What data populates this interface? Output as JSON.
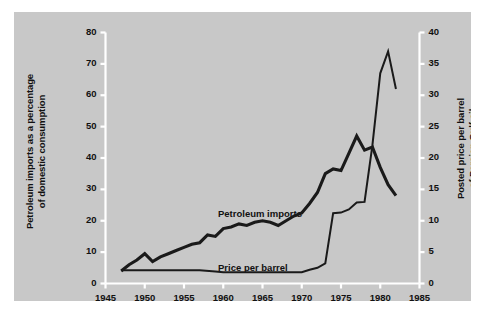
{
  "chart_data": {
    "type": "line",
    "title": "",
    "subtitle": "",
    "xlabel": "",
    "xlim": [
      1945,
      1985
    ],
    "xticks": [
      1945,
      1950,
      1955,
      1960,
      1965,
      1970,
      1975,
      1980,
      1985
    ],
    "grid": false,
    "legend_position": "inline-labels",
    "axes": [
      {
        "id": "left",
        "label": "Petroleum imports as a percentage\nof domestic consumption",
        "lim": [
          0,
          80
        ],
        "ticks": [
          0,
          10,
          20,
          30,
          40,
          50,
          60,
          70,
          80
        ]
      },
      {
        "id": "right",
        "label": "Posted price per barrel\nof Persian Gulf oil",
        "lim": [
          0,
          40
        ],
        "ticks": [
          0,
          5,
          10,
          15,
          20,
          25,
          30,
          35,
          40
        ]
      }
    ],
    "series": [
      {
        "name": "Petroleum imports",
        "axis": "left",
        "label": "Petroleum imports",
        "color": "#1a1a1a",
        "width": 3.1,
        "x": [
          1947,
          1948,
          1949,
          1950,
          1951,
          1952,
          1953,
          1954,
          1955,
          1956,
          1957,
          1958,
          1959,
          1960,
          1961,
          1962,
          1963,
          1964,
          1965,
          1966,
          1967,
          1968,
          1969,
          1970,
          1971,
          1972,
          1973,
          1974,
          1975,
          1976,
          1977,
          1978,
          1979,
          1980,
          1981,
          1982
        ],
        "y": [
          4.0,
          6.0,
          7.5,
          9.5,
          7.0,
          8.5,
          9.5,
          10.5,
          11.5,
          12.5,
          13.0,
          15.5,
          15.0,
          17.5,
          18.0,
          19.0,
          18.5,
          19.5,
          20.0,
          19.5,
          18.5,
          20.0,
          21.5,
          22.5,
          25.5,
          29.0,
          35.0,
          36.5,
          36.0,
          41.5,
          47.0,
          42.5,
          43.5,
          37.0,
          31.5,
          28.0
        ]
      },
      {
        "name": "Price per barrel",
        "axis": "right",
        "label": "Price per barrel",
        "color": "#1a1a1a",
        "width": 2.0,
        "x": [
          1947,
          1950,
          1955,
          1957,
          1959,
          1960,
          1965,
          1970,
          1971,
          1972,
          1973,
          1974,
          1975,
          1976,
          1977,
          1978,
          1979,
          1980,
          1981,
          1982
        ],
        "y": [
          2.1,
          2.1,
          2.1,
          2.1,
          1.9,
          1.8,
          1.8,
          1.8,
          2.2,
          2.5,
          3.2,
          11.2,
          11.3,
          11.8,
          12.9,
          13.0,
          22.0,
          33.5,
          37.0,
          31.0
        ]
      }
    ]
  },
  "colors": {
    "panel_background": "#c8c8c8",
    "figure_background": "#ffffff",
    "axis_line": "#ffffff",
    "line": "#1a1a1a",
    "text": "#111111"
  }
}
